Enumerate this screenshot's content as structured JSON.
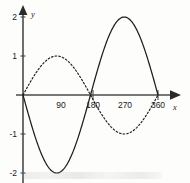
{
  "figure": {
    "x_axis_label": "x",
    "y_axis_label": "y",
    "x_tick_labels": [
      "90",
      "180",
      "270",
      "360"
    ],
    "y_tick_labels": [
      "2",
      "1",
      "-1",
      "-2"
    ]
  },
  "chart_data": {
    "type": "line",
    "title": "",
    "subtitle": "",
    "xlabel": "x",
    "ylabel": "y",
    "xlim": [
      0,
      380
    ],
    "ylim": [
      -2.3,
      2.3
    ],
    "x_ticks": [
      90,
      180,
      270,
      360
    ],
    "x_tick_labels": [
      "90",
      "180",
      "270",
      "360"
    ],
    "x_tick_marks_drawn": [
      180,
      360
    ],
    "y_ticks": [
      2,
      1,
      -1,
      -2
    ],
    "y_tick_labels": [
      "2",
      "1",
      "-1",
      "-2"
    ],
    "grid": false,
    "legend": "none",
    "annotations": [],
    "series": [
      {
        "name": "y = -2 sin(x)",
        "style": "solid",
        "amplitude": 2,
        "period": 360,
        "phase_deg": 180,
        "color": "#1d1d1d",
        "x": [
          0,
          15,
          30,
          45,
          60,
          75,
          90,
          105,
          120,
          135,
          150,
          165,
          180,
          195,
          210,
          225,
          240,
          255,
          270,
          285,
          300,
          315,
          330,
          345,
          360
        ],
        "values": [
          0,
          -0.52,
          -1.0,
          -1.41,
          -1.73,
          -1.93,
          -2.0,
          -1.93,
          -1.73,
          -1.41,
          -1.0,
          -0.52,
          0,
          0.52,
          1.0,
          1.41,
          1.73,
          1.93,
          2.0,
          1.93,
          1.73,
          1.41,
          1.0,
          0.52,
          0
        ]
      },
      {
        "name": "y = sin(x)",
        "style": "dotted",
        "amplitude": 1,
        "period": 360,
        "phase_deg": 0,
        "color": "#1d1d1d",
        "x": [
          0,
          15,
          30,
          45,
          60,
          75,
          90,
          105,
          120,
          135,
          150,
          165,
          180,
          195,
          210,
          225,
          240,
          255,
          270,
          285,
          300,
          315,
          330,
          345,
          360
        ],
        "values": [
          0,
          0.26,
          0.5,
          0.71,
          0.87,
          0.97,
          1.0,
          0.97,
          0.87,
          0.71,
          0.5,
          0.26,
          0,
          -0.26,
          -0.5,
          -0.71,
          -0.87,
          -0.97,
          -1.0,
          -0.97,
          -0.87,
          -0.71,
          -0.5,
          -0.26,
          0
        ]
      }
    ]
  }
}
